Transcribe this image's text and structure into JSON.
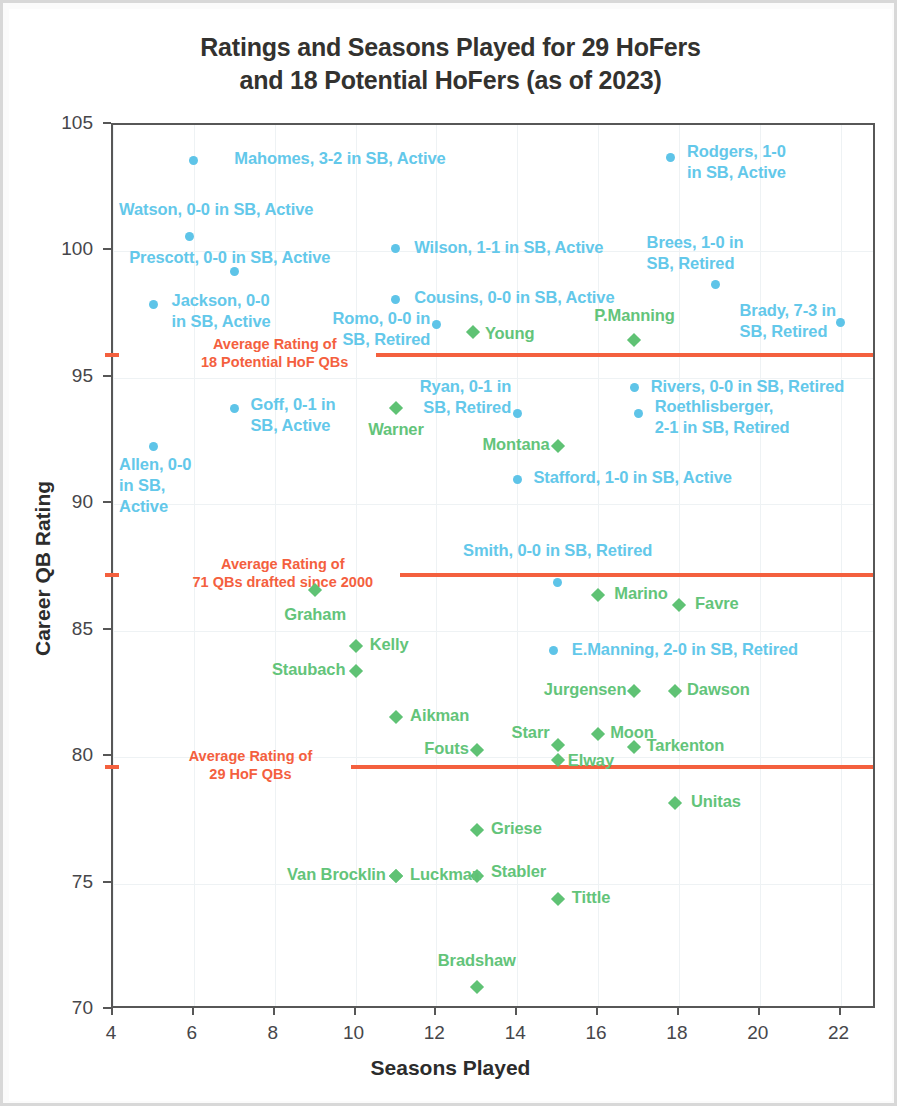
{
  "chart_data": {
    "type": "scatter",
    "title": "Ratings and Seasons Played for 29 HoFers and 18 Potential HoFers (as of 2023)",
    "title_line1": "Ratings and Seasons Played for 29 HoFers",
    "title_line2": "and 18 Potential HoFers (as of 2023)",
    "xlabel": "Seasons Played",
    "ylabel": "Career QB Rating",
    "xlim": [
      4,
      22.9
    ],
    "ylim": [
      70,
      105
    ],
    "xticks": [
      4,
      6,
      8,
      10,
      12,
      14,
      16,
      18,
      20,
      22
    ],
    "yticks": [
      70,
      75,
      80,
      85,
      90,
      95,
      100,
      105
    ],
    "grid": true,
    "legend": "none",
    "colors": {
      "potential_hofer": "#5EC4E8",
      "hofer": "#5FC274",
      "average_line": "#F4603E",
      "axis": "#575757",
      "title": "#33322F"
    },
    "series": [
      {
        "name": "Potential HoFers",
        "color": "#5EC4E8",
        "marker": "circle",
        "points": [
          {
            "label": "Mahomes, 3-2 in SB, Active",
            "x": 6.0,
            "y": 103.6,
            "lx": 7.0,
            "ly": 103.6,
            "align": "left"
          },
          {
            "label": "Watson, 0-0 in SB, Active",
            "x": 5.9,
            "y": 100.6,
            "lx": 4.15,
            "ly": 101.6,
            "align": "left"
          },
          {
            "label": "Prescott, 0-0 in SB, Active",
            "x": 7.0,
            "y": 99.2,
            "lx": 4.4,
            "ly": 99.7,
            "align": "left"
          },
          {
            "label": "Jackson, 0-0\nin SB, Active",
            "x": 5.0,
            "y": 97.9,
            "lx": 5.45,
            "ly": 98.0,
            "align": "left"
          },
          {
            "label": "Wilson, 1-1 in SB, Active",
            "x": 11.0,
            "y": 100.1,
            "lx": 11.45,
            "ly": 100.1,
            "align": "left"
          },
          {
            "label": "Cousins, 0-0 in SB, Active",
            "x": 11.0,
            "y": 98.1,
            "lx": 11.45,
            "ly": 98.1,
            "align": "left"
          },
          {
            "label": "Romo, 0-0 in\nSB, Retired",
            "x": 12.0,
            "y": 97.1,
            "lx": 11.85,
            "ly": 97.3,
            "align": "right"
          },
          {
            "label": "Rodgers, 1-0\nin SB, Active",
            "x": 17.8,
            "y": 103.7,
            "lx": 18.2,
            "ly": 103.9,
            "align": "left"
          },
          {
            "label": "Brees, 1-0 in\nSB, Retired",
            "x": 18.9,
            "y": 98.7,
            "lx": 17.2,
            "ly": 100.3,
            "align": "left"
          },
          {
            "label": "Brady, 7-3 in\nSB, Retired",
            "x": 22.0,
            "y": 97.2,
            "lx": 19.5,
            "ly": 97.6,
            "align": "left"
          },
          {
            "label": "Ryan, 0-1 in\nSB, Retired",
            "x": 14.0,
            "y": 93.6,
            "lx": 13.85,
            "ly": 94.6,
            "align": "right"
          },
          {
            "label": "Rivers, 0-0 in SB, Retired",
            "x": 16.9,
            "y": 94.6,
            "lx": 17.3,
            "ly": 94.6,
            "align": "left"
          },
          {
            "label": "Roethlisberger,\n2-1 in SB, Retired",
            "x": 17.0,
            "y": 93.6,
            "lx": 17.4,
            "ly": 93.8,
            "align": "left"
          },
          {
            "label": "Goff, 0-1 in\nSB, Active",
            "x": 7.0,
            "y": 93.8,
            "lx": 7.4,
            "ly": 93.9,
            "align": "left"
          },
          {
            "label": "Allen, 0-0\nin SB,\nActive",
            "x": 5.0,
            "y": 92.3,
            "lx": 4.15,
            "ly": 91.5,
            "align": "left"
          },
          {
            "label": "Stafford, 1-0 in SB, Active",
            "x": 14.0,
            "y": 91.0,
            "lx": 14.4,
            "ly": 91.0,
            "align": "left"
          },
          {
            "label": "Smith, 0-0 in SB, Retired",
            "x": 15.0,
            "y": 86.9,
            "lx": 15.0,
            "ly": 88.1,
            "align": "center"
          },
          {
            "label": "E.Manning, 2-0 in SB, Retired",
            "x": 14.9,
            "y": 84.2,
            "lx": 15.35,
            "ly": 84.2,
            "align": "left"
          }
        ]
      },
      {
        "name": "HoFers",
        "color": "#5FC274",
        "marker": "diamond",
        "points": [
          {
            "label": "Young",
            "x": 12.9,
            "y": 96.8,
            "lx": 13.2,
            "ly": 96.7,
            "align": "left"
          },
          {
            "label": "P.Manning",
            "x": 16.9,
            "y": 96.5,
            "lx": 16.9,
            "ly": 97.4,
            "align": "center"
          },
          {
            "label": "Warner",
            "x": 11.0,
            "y": 93.8,
            "lx": 11.0,
            "ly": 92.9,
            "align": "center"
          },
          {
            "label": "Montana",
            "x": 15.0,
            "y": 92.3,
            "lx": 14.8,
            "ly": 92.3,
            "align": "right"
          },
          {
            "label": "Graham",
            "x": 9.0,
            "y": 86.6,
            "lx": 9.0,
            "ly": 85.6,
            "align": "center"
          },
          {
            "label": "Marino",
            "x": 16.0,
            "y": 86.4,
            "lx": 16.4,
            "ly": 86.4,
            "align": "left"
          },
          {
            "label": "Favre",
            "x": 18.0,
            "y": 86.0,
            "lx": 18.4,
            "ly": 86.0,
            "align": "left"
          },
          {
            "label": "Kelly",
            "x": 10.0,
            "y": 84.4,
            "lx": 10.35,
            "ly": 84.4,
            "align": "left"
          },
          {
            "label": "Staubach",
            "x": 10.0,
            "y": 83.4,
            "lx": 9.75,
            "ly": 83.4,
            "align": "right"
          },
          {
            "label": "Jurgensen",
            "x": 16.9,
            "y": 82.6,
            "lx": 16.7,
            "ly": 82.6,
            "align": "right"
          },
          {
            "label": "Dawson",
            "x": 17.9,
            "y": 82.6,
            "lx": 18.2,
            "ly": 82.6,
            "align": "left"
          },
          {
            "label": "Aikman",
            "x": 11.0,
            "y": 81.6,
            "lx": 11.35,
            "ly": 81.6,
            "align": "left"
          },
          {
            "label": "Moon",
            "x": 16.0,
            "y": 80.9,
            "lx": 16.3,
            "ly": 80.9,
            "align": "left"
          },
          {
            "label": "Starr",
            "x": 15.0,
            "y": 80.5,
            "lx": 14.8,
            "ly": 80.9,
            "align": "right"
          },
          {
            "label": "Tarkenton",
            "x": 16.9,
            "y": 80.4,
            "lx": 17.2,
            "ly": 80.4,
            "align": "left"
          },
          {
            "label": "Fouts",
            "x": 13.0,
            "y": 80.3,
            "lx": 12.8,
            "ly": 80.3,
            "align": "right"
          },
          {
            "label": "Elway",
            "x": 15.0,
            "y": 79.9,
            "lx": 15.25,
            "ly": 79.8,
            "align": "left"
          },
          {
            "label": "Unitas",
            "x": 17.9,
            "y": 78.2,
            "lx": 18.3,
            "ly": 78.2,
            "align": "left"
          },
          {
            "label": "Griese",
            "x": 13.0,
            "y": 77.1,
            "lx": 13.35,
            "ly": 77.1,
            "align": "left"
          },
          {
            "label": "Luckman",
            "x": 11.0,
            "y": 75.3,
            "lx": 11.35,
            "ly": 75.3,
            "align": "left"
          },
          {
            "label": "Van Brocklin",
            "x": 11.0,
            "y": 75.3,
            "lx": 10.75,
            "ly": 75.3,
            "align": "right"
          },
          {
            "label": "Stabler",
            "x": 13.0,
            "y": 75.3,
            "lx": 13.35,
            "ly": 75.4,
            "align": "left"
          },
          {
            "label": "Tittle",
            "x": 15.0,
            "y": 74.4,
            "lx": 15.35,
            "ly": 74.4,
            "align": "left"
          },
          {
            "label": "Bradshaw",
            "x": 13.0,
            "y": 70.9,
            "lx": 13.0,
            "ly": 71.9,
            "align": "center"
          }
        ]
      }
    ],
    "reference_lines": [
      {
        "id": "potential-hof-avg",
        "value": 95.9,
        "label": "Average Rating of\n18 Potential HoF QBs",
        "label_x": 8.0,
        "line_start_x": 10.5,
        "color": "#F4603E"
      },
      {
        "id": "drafted-2000-avg",
        "value": 87.2,
        "label": "Average Rating of\n71 QBs drafted since 2000",
        "label_x": 8.2,
        "line_start_x": 11.1,
        "color": "#F4603E"
      },
      {
        "id": "hof-avg",
        "value": 79.6,
        "label": "Average Rating of\n29 HoF QBs",
        "label_x": 7.4,
        "line_start_x": 9.9,
        "color": "#F4603E"
      }
    ]
  }
}
